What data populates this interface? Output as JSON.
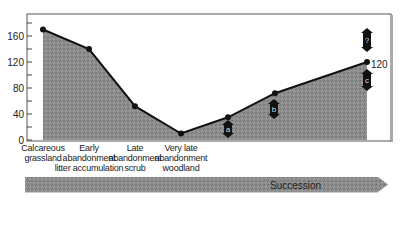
{
  "chart_data": {
    "type": "area",
    "title": "",
    "xlabel": "",
    "ylabel": "",
    "ylim": [
      0,
      180
    ],
    "yticks": [
      0,
      40,
      80,
      120,
      160
    ],
    "grid": false,
    "legend": null,
    "categories": [
      "Calcareous grassland",
      "Early abandonment litter accumulation",
      "Late abandonment scrub",
      "Very late abandonment woodland",
      "",
      "",
      ""
    ],
    "values": [
      170,
      140,
      52,
      10,
      35,
      72,
      120
    ],
    "end_value_label": "120",
    "annotations": [
      {
        "label": "a",
        "type": "double-arrow",
        "near_point_index": 4
      },
      {
        "label": "b",
        "type": "double-arrow",
        "near_point_index": 5
      },
      {
        "label": "c",
        "type": "double-arrow",
        "near_point_index": 6,
        "position": "below"
      },
      {
        "label": "?",
        "type": "double-arrow",
        "near_point_index": 6,
        "position": "above"
      }
    ],
    "bottom_arrow_label": "Succession"
  },
  "axis": {
    "y_ticks": [
      "0",
      "40",
      "80",
      "120",
      "160"
    ]
  },
  "x_labels": [
    [
      "Calcareous",
      "grassland"
    ],
    [
      "Early",
      "abandonment",
      "litter accumulation"
    ],
    [
      "Late",
      "abandonment",
      "scrub"
    ],
    [
      "Very late",
      "abandonment",
      "woodland"
    ]
  ],
  "end_label": "120",
  "markers": {
    "a": "a",
    "b": "b",
    "c": "c",
    "q": "?"
  },
  "succession": {
    "label": "Succession"
  },
  "colors": {
    "fill": "#8a8a8a",
    "line": "#111111",
    "arrow": "#9a9a9a"
  }
}
